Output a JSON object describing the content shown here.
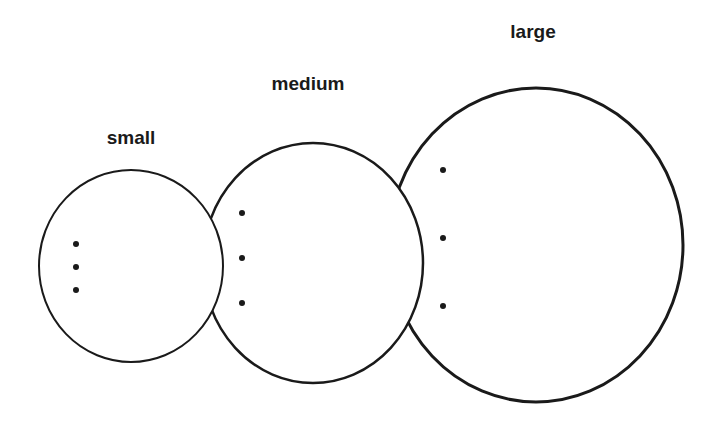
{
  "diagram": {
    "circles": [
      {
        "label": "small",
        "dots": 3
      },
      {
        "label": "medium",
        "dots": 3
      },
      {
        "label": "large",
        "dots": 3
      }
    ]
  }
}
